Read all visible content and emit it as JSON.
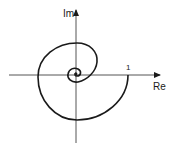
{
  "diagram": {
    "type": "nyquist-spiral",
    "axes": {
      "x_label": "Re",
      "y_label": "Im"
    },
    "annotations": {
      "real_axis_tick": "1"
    },
    "colors": {
      "stroke": "#1a1a1a",
      "background": "#ffffff"
    }
  }
}
